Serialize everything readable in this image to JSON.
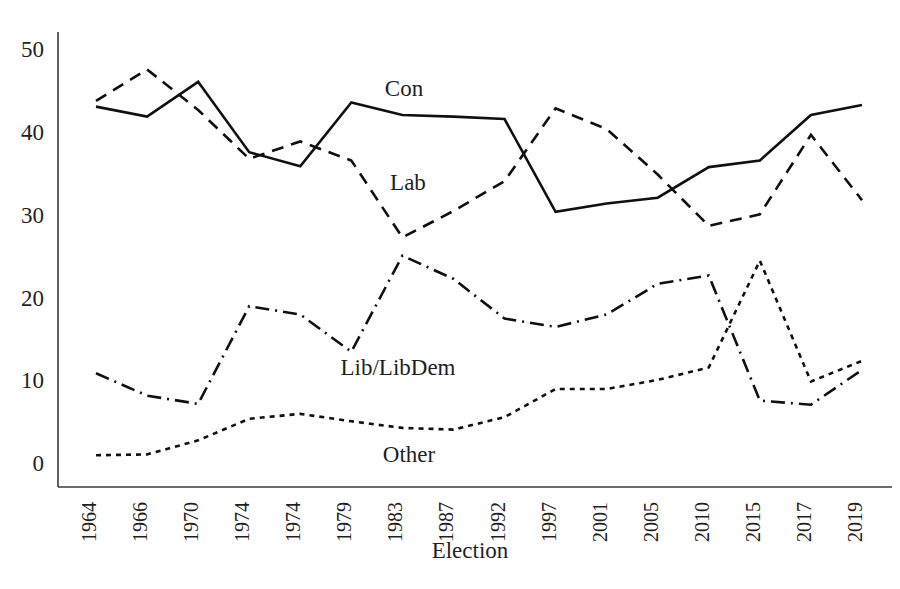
{
  "chart_data": {
    "type": "line",
    "title": "",
    "xlabel": "Election",
    "ylabel": "",
    "ylim": [
      0,
      50
    ],
    "yticks": [
      0,
      10,
      20,
      30,
      40,
      50
    ],
    "grid": false,
    "legend_position": "inline-annotations",
    "categories": [
      "1964",
      "1966",
      "1970",
      "1974",
      "1974",
      "1979",
      "1983",
      "1987",
      "1992",
      "1997",
      "2001",
      "2005",
      "2010",
      "2015",
      "2017",
      "2019"
    ],
    "series": [
      {
        "name": "Con",
        "style": "solid",
        "label": "Con",
        "values": [
          43.4,
          42.2,
          46.4,
          37.9,
          36.2,
          43.9,
          42.4,
          42.2,
          41.9,
          30.7,
          31.7,
          32.4,
          36.1,
          36.9,
          42.4,
          43.6
        ]
      },
      {
        "name": "Lab",
        "style": "dashed",
        "label": "Lab",
        "values": [
          44.1,
          47.9,
          43.0,
          37.1,
          39.2,
          36.9,
          27.6,
          30.8,
          34.4,
          43.2,
          40.7,
          35.2,
          29.0,
          30.4,
          40.0,
          32.1
        ]
      },
      {
        "name": "Lib/LibDem",
        "style": "dash-dot",
        "label": "Lib/LibDem",
        "values": [
          11.2,
          8.5,
          7.5,
          19.3,
          18.3,
          13.8,
          25.4,
          22.6,
          17.8,
          16.8,
          18.3,
          22.0,
          23.0,
          7.9,
          7.4,
          11.6
        ]
      },
      {
        "name": "Other",
        "style": "dotted",
        "label": "Other",
        "values": [
          1.3,
          1.4,
          3.1,
          5.7,
          6.3,
          5.4,
          4.6,
          4.4,
          5.9,
          9.3,
          9.3,
          10.4,
          11.9,
          24.8,
          10.2,
          12.7
        ]
      }
    ],
    "annotations": [
      {
        "text": "Con",
        "series": "Con"
      },
      {
        "text": "Lab",
        "series": "Lab"
      },
      {
        "text": "Lib/LibDem",
        "series": "Lib/LibDem"
      },
      {
        "text": "Other",
        "series": "Other"
      }
    ]
  },
  "labels": {
    "con": "Con",
    "lab": "Lab",
    "lib": "Lib/LibDem",
    "other": "Other",
    "xaxis": "Election"
  },
  "colors": {
    "line": "#101010",
    "axis": "#3b3b3b",
    "text": "#1f1f1f",
    "background": "#ffffff"
  }
}
